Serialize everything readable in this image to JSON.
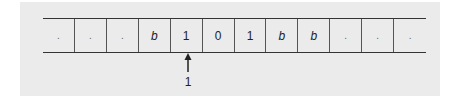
{
  "tape": {
    "cells": [
      {
        "symbol": ".",
        "style": "dot"
      },
      {
        "symbol": ".",
        "style": "dot"
      },
      {
        "symbol": ".",
        "style": "dot"
      },
      {
        "symbol": "b",
        "style": "italic"
      },
      {
        "symbol": "1",
        "style": "normal"
      },
      {
        "symbol": "0",
        "style": "normal"
      },
      {
        "symbol": "1",
        "style": "normal"
      },
      {
        "symbol": "b",
        "style": "italic"
      },
      {
        "symbol": "b",
        "style": "italic"
      },
      {
        "symbol": ".",
        "style": "dot"
      },
      {
        "symbol": ".",
        "style": "dot"
      },
      {
        "symbol": ".",
        "style": "dot"
      }
    ]
  },
  "head": {
    "position_index": 4,
    "state_label": "1",
    "icon": "up-arrow-icon"
  },
  "colors": {
    "panel_background": "#ebebeb",
    "line": "#333333",
    "text": "#222222"
  }
}
